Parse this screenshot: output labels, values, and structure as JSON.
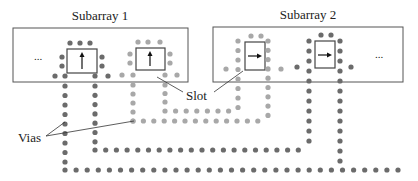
{
  "labels": {
    "subarray1": "Subarray 1",
    "subarray2": "Subarray 2",
    "slot": "Slot",
    "vias": "Vias",
    "ellipsis_left": "...",
    "ellipsis_right": "..."
  },
  "colors": {
    "dark_via": "#6b6b6b",
    "light_via": "#a8a8a8",
    "box_stroke": "#555555",
    "slot_stroke": "#444444",
    "arrow": "#111111"
  },
  "subarrays": [
    {
      "name": "Subarray 1",
      "box": {
        "x": 13,
        "y": 28,
        "w": 175,
        "h": 54
      }
    },
    {
      "name": "Subarray 2",
      "box": {
        "x": 213,
        "y": 27,
        "w": 190,
        "h": 55
      }
    }
  ],
  "slots": [
    {
      "x": 67,
      "y": 49,
      "w": 30,
      "h": 24,
      "arrow": "up"
    },
    {
      "x": 136,
      "y": 48,
      "w": 29,
      "h": 22,
      "arrow": "up"
    },
    {
      "x": 245,
      "y": 42,
      "w": 20,
      "h": 28,
      "arrow": "right"
    },
    {
      "x": 315,
      "y": 41,
      "w": 20,
      "h": 27,
      "arrow": "right"
    }
  ]
}
